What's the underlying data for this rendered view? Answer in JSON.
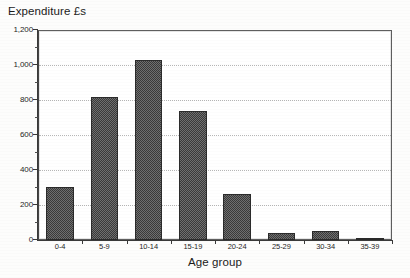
{
  "chart_data": {
    "type": "bar",
    "title": "Expenditure £s",
    "xlabel": "Age group",
    "ylabel": "",
    "categories": [
      "0-4",
      "5-9",
      "10-14",
      "15-19",
      "20-24",
      "25-29",
      "30-34",
      "35-39"
    ],
    "values": [
      305,
      820,
      1030,
      735,
      265,
      40,
      50,
      10
    ],
    "ylim": [
      0,
      1200
    ],
    "y_major_ticks": [
      0,
      200,
      400,
      600,
      800,
      1000,
      1200
    ],
    "y_tick_labels": [
      "0",
      "200",
      "400",
      "600",
      "800",
      "1,000",
      "1,200"
    ],
    "y_minor_ticks": [
      100,
      300,
      500,
      700,
      900,
      1100
    ],
    "grid": "horizontal-dotted-major",
    "legend": null,
    "legend_position": "none",
    "series": [
      {
        "name": "Expenditure",
        "values": [
          305,
          820,
          1030,
          735,
          265,
          40,
          50,
          10
        ]
      }
    ],
    "bar_fill": "#4a4a4a",
    "bar_edge": "#2b2b2b",
    "gridline_color": "#b6b6b6",
    "axis_color": "#3a3a3a",
    "background": "#ffffff"
  },
  "figure": {
    "title_text": "Expenditure £s",
    "x_axis_title": "Age group"
  }
}
